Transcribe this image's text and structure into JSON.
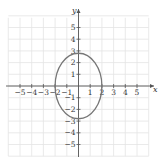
{
  "chart_data": {
    "type": "line",
    "title": "",
    "xlabel": "x",
    "ylabel": "y",
    "xlim": [
      -6,
      6
    ],
    "ylim": [
      -6,
      6
    ],
    "grid": true,
    "x_ticks": [
      -5,
      -4,
      -3,
      -2,
      -1,
      1,
      2,
      3,
      4,
      5
    ],
    "y_ticks": [
      -5,
      -4,
      -3,
      -2,
      -1,
      1,
      2,
      3,
      4,
      5
    ],
    "x_tick_labels": [
      "−5",
      "−4",
      "−3",
      "−2",
      "−1",
      "1",
      "2",
      "3",
      "4",
      "5"
    ],
    "y_tick_labels": [
      "−5",
      "−4",
      "−3",
      "−2",
      "−1",
      "1",
      "2",
      "3",
      "4",
      "5"
    ],
    "series": [
      {
        "name": "ellipse",
        "shape": "ellipse",
        "center": [
          0,
          0
        ],
        "semi_axis_x": 2,
        "semi_axis_y": 2.8,
        "color": "#777777"
      }
    ]
  },
  "colors": {
    "grid": "#e4e4e4",
    "axis": "#555555",
    "curve": "#777777"
  }
}
